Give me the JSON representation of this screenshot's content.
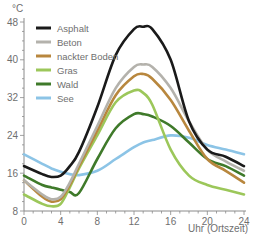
{
  "chart_data": {
    "type": "line",
    "title": "",
    "xlabel": "Uhr (Ortszeit)",
    "ylabel": "°C",
    "xlim": [
      0,
      24
    ],
    "ylim": [
      8,
      48
    ],
    "x_ticks": [
      0,
      4,
      8,
      12,
      16,
      20,
      24
    ],
    "y_ticks": [
      8,
      16,
      24,
      32,
      40,
      48
    ],
    "grid": false,
    "legend_position": "upper-left",
    "x": [
      0,
      2,
      3,
      4,
      5,
      6,
      8,
      10,
      12,
      13,
      14,
      16,
      18,
      20,
      22,
      24
    ],
    "series": [
      {
        "name": "Asphalt",
        "color": "#1a1a1a",
        "values": [
          17.5,
          15.8,
          15.2,
          15.5,
          17.5,
          20.5,
          30,
          41,
          46.5,
          47,
          46.5,
          40,
          27,
          21,
          19.5,
          17.5
        ]
      },
      {
        "name": "Beton",
        "color": "#b4b2ac",
        "values": [
          14.5,
          11.5,
          10.5,
          11,
          14,
          18,
          26,
          34,
          38.5,
          39,
          38.5,
          34,
          27,
          21,
          18.5,
          16.5
        ]
      },
      {
        "name": "nackter Boden",
        "color": "#b8873e",
        "values": [
          14.5,
          11,
          10,
          10.5,
          13.5,
          17.5,
          25,
          32.5,
          36.5,
          37,
          36,
          31.5,
          25,
          19,
          16.5,
          14
        ]
      },
      {
        "name": "Gras",
        "color": "#9cc75a",
        "values": [
          11.5,
          9.5,
          9,
          9.5,
          13,
          17,
          24,
          31,
          33.5,
          33,
          30.5,
          21,
          15.5,
          13.5,
          12.5,
          11.5
        ]
      },
      {
        "name": "Wald",
        "color": "#3f7a2a",
        "values": [
          15.5,
          13.5,
          13,
          12.5,
          12,
          11.8,
          19,
          25.5,
          28.5,
          28.5,
          28,
          26,
          22.5,
          19,
          17.5,
          15.5
        ]
      },
      {
        "name": "See",
        "color": "#8cc4e6",
        "values": [
          20,
          18,
          17,
          16.3,
          15.8,
          15.6,
          16.5,
          19,
          21.5,
          22.5,
          23,
          24,
          23.5,
          22,
          21,
          20
        ]
      }
    ]
  }
}
